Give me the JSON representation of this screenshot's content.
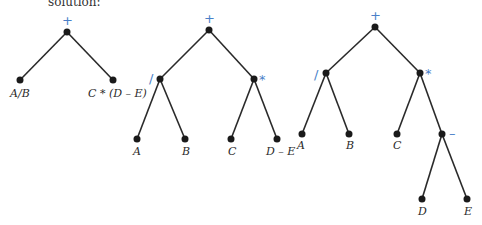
{
  "header_text": "solution:",
  "colors": {
    "operator": "#4a7fc8",
    "edge": "#2a2a2a",
    "node": "#1a1a1a"
  },
  "trees": [
    {
      "root_op": "+",
      "left_label": "A/B",
      "right_label": "C * (D – E)"
    },
    {
      "root_op": "+",
      "left_op": "/",
      "right_op": "*",
      "leaves": [
        "A",
        "B",
        "C",
        "D – E"
      ]
    },
    {
      "root_op": "+",
      "left_op": "/",
      "right_op": "*",
      "sub_op": "–",
      "leaves": [
        "A",
        "B",
        "C",
        "D",
        "E"
      ]
    }
  ]
}
